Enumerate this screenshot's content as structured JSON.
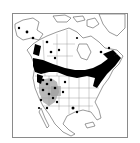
{
  "map": {
    "region": "North America",
    "type": "species distribution map",
    "colors": {
      "background": "#ffffff",
      "frame": "#8a8a8a",
      "outline": "#555555",
      "occurrence": "#000000",
      "range_shading": "#9a9a9a"
    },
    "legend": null,
    "labels": []
  }
}
